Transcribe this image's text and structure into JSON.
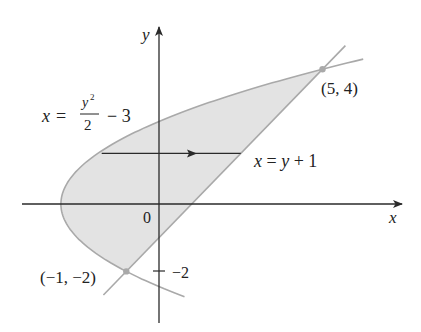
{
  "figure": {
    "colors": {
      "region_fill": "#e3e3e3",
      "curve_stroke": "#a9a9a9",
      "axis_stroke": "#2a2a2a",
      "point_fill": "#a9a9a9",
      "text": "#222222"
    },
    "axes": {
      "x_label": "x",
      "y_label": "y",
      "origin_label": "0",
      "y_tick_label": "−2",
      "y_tick_value": -2
    },
    "curves": {
      "parabola": {
        "label_lhs": "x =",
        "label_num_base": "y",
        "label_num_exp": "2",
        "label_den": "2",
        "label_tail": "− 3",
        "equation": "x = y^2/2 - 3"
      },
      "line": {
        "label": "x = y + 1",
        "equation": "x = y + 1"
      }
    },
    "points": [
      {
        "label": "(5, 4)",
        "x": 5,
        "y": 4
      },
      {
        "label": "(−1, −2)",
        "x": -1,
        "y": -2
      }
    ],
    "arrow": {
      "y": 1.5,
      "direction": "right",
      "meaning": "horizontal strip from parabola (left) to line (right)"
    },
    "view": {
      "x_range": [
        -4.2,
        7.4
      ],
      "y_range": [
        -3.6,
        5.3
      ]
    }
  }
}
